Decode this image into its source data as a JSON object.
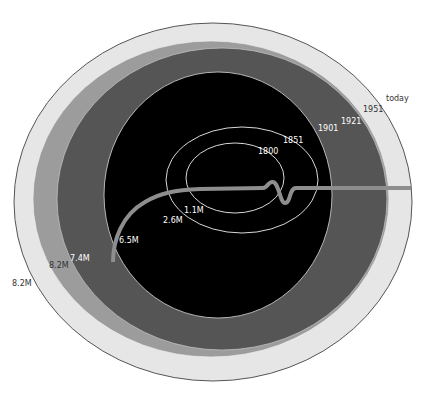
{
  "diagram": {
    "type": "nested-ellipse growth diagram with river",
    "colors": {
      "today": "#e6e6e6",
      "1951": "#9c9c9c",
      "1921": "#555555",
      "1901": "#000000",
      "outline": "#d8d8d8",
      "river": "#8e8e8e",
      "border": "#555555"
    },
    "rings": [
      {
        "year": "today",
        "population": "8.2M"
      },
      {
        "year": "1951",
        "population": "8.2M"
      },
      {
        "year": "1921",
        "population": "7.4M"
      },
      {
        "year": "1901",
        "population": "6.5M"
      },
      {
        "year": "1851",
        "population": "2.6M"
      },
      {
        "year": "1800",
        "population": "1.1M"
      }
    ],
    "year_labels": {
      "y1800": "1800",
      "y1851": "1851",
      "y1901": "1901",
      "y1921": "1921",
      "y1951": "1951",
      "today": "today"
    },
    "population_labels": {
      "p1800": "1.1M",
      "p1851": "2.6M",
      "p1901": "6.5M",
      "p1921": "7.4M",
      "p1951": "8.2M",
      "today": "8.2M"
    }
  }
}
